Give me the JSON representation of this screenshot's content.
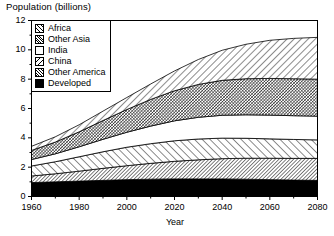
{
  "chart_data": {
    "type": "area",
    "title": "Population (billions)",
    "xlabel": "Year",
    "ylabel": "Population (billions)",
    "stacked": true,
    "grid": false,
    "legend_position": "top-left-inside",
    "xlim": [
      1960,
      2080
    ],
    "ylim": [
      0,
      12
    ],
    "xticks": [
      1960,
      1980,
      2000,
      2020,
      2040,
      2060,
      2080
    ],
    "yticks": [
      0,
      2,
      4,
      6,
      8,
      10,
      12
    ],
    "x": [
      1960,
      1970,
      1980,
      1990,
      2000,
      2010,
      2020,
      2030,
      2040,
      2050,
      2060,
      2070,
      2080
    ],
    "series": [
      {
        "name": "Developed",
        "pattern": "solid-black",
        "color": "#000000",
        "values": [
          0.95,
          1.0,
          1.05,
          1.1,
          1.15,
          1.18,
          1.2,
          1.2,
          1.2,
          1.18,
          1.15,
          1.12,
          1.1
        ]
      },
      {
        "name": "Other America",
        "pattern": "dense-diagonal-hatch",
        "color": "#000000",
        "values": [
          0.45,
          0.55,
          0.68,
          0.82,
          0.95,
          1.08,
          1.2,
          1.3,
          1.38,
          1.43,
          1.46,
          1.48,
          1.5
        ]
      },
      {
        "name": "China",
        "pattern": "diagonal-hatch-backslash",
        "color": "#000000",
        "values": [
          0.68,
          0.82,
          0.98,
          1.13,
          1.26,
          1.34,
          1.4,
          1.42,
          1.4,
          1.36,
          1.32,
          1.29,
          1.26
        ]
      },
      {
        "name": "India",
        "pattern": "blank-white",
        "color": "#ffffff",
        "values": [
          0.44,
          0.54,
          0.68,
          0.85,
          1.02,
          1.2,
          1.36,
          1.48,
          1.56,
          1.6,
          1.62,
          1.62,
          1.62
        ]
      },
      {
        "name": "Other Asia",
        "pattern": "dense-cross-hatch",
        "color": "#000000",
        "values": [
          0.62,
          0.8,
          1.02,
          1.28,
          1.55,
          1.82,
          2.05,
          2.24,
          2.38,
          2.46,
          2.5,
          2.52,
          2.52
        ]
      },
      {
        "name": "Africa",
        "pattern": "wide-diagonal-hatch-slash",
        "color": "#000000",
        "values": [
          0.28,
          0.36,
          0.48,
          0.64,
          0.82,
          1.05,
          1.35,
          1.7,
          2.05,
          2.35,
          2.6,
          2.75,
          2.85
        ]
      }
    ],
    "totals": [
      3.02,
      4.07,
      4.89,
      5.82,
      6.75,
      7.67,
      8.56,
      9.34,
      9.97,
      10.38,
      10.65,
      10.78,
      10.85
    ]
  },
  "axes": {
    "y_tick_labels": [
      "12",
      "10",
      "8",
      "6",
      "4",
      "2",
      "0"
    ],
    "x_tick_labels": [
      "1960",
      "1980",
      "2000",
      "2020",
      "2040",
      "2060",
      "2080"
    ],
    "x_axis_title": "Year"
  },
  "legend": {
    "items": [
      {
        "label": "Africa",
        "swatch": "africa-swatch"
      },
      {
        "label": "Other Asia",
        "swatch": "other-asia-swatch"
      },
      {
        "label": "India",
        "swatch": "india-swatch"
      },
      {
        "label": "China",
        "swatch": "china-swatch"
      },
      {
        "label": "Other America",
        "swatch": "other-america-swatch"
      },
      {
        "label": "Developed",
        "swatch": "developed-swatch"
      }
    ]
  }
}
